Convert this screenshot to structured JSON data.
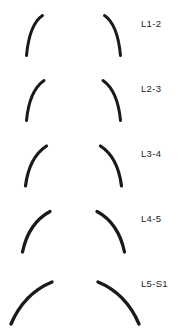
{
  "figure": {
    "width": 187,
    "height": 331,
    "background_color": "#ffffff",
    "stroke_color": "#1a1a1a",
    "label_color": "#232323"
  },
  "levels": [
    {
      "label": "L1-2",
      "label_x": 141,
      "label_y": 19,
      "left_arc": "M 42.5 15.5 C 33.5 21.5 28.5 34.5 26.5 55.5",
      "right_arc": "M 104.5 15.5 C 113.5 21.5 118.5 34.5 120.5 55.5",
      "stroke_width": 3.0
    },
    {
      "label": "L2-3",
      "label_x": 141,
      "label_y": 84,
      "left_arc": "M 44.0 80.5 C 34.0 87.5 28.5 99.5 26.5 120.5",
      "right_arc": "M 103.0 80.5 C 113.0 87.5 118.5 99.5 120.5 120.5",
      "stroke_width": 3.0
    },
    {
      "label": "L3-4",
      "label_x": 141,
      "label_y": 149,
      "left_arc": "M 46.5 146.0 C 35.0 153.5 28.0 166.0 25.5 186.0",
      "right_arc": "M 100.5 146.0 C 112.0 153.5 119.0 166.0 121.5 186.0",
      "stroke_width": 3.2
    },
    {
      "label": "L4-5",
      "label_x": 141,
      "label_y": 214,
      "left_arc": "M 50.0 211.5 C 36.0 219.0 26.5 233.0 22.5 252.0",
      "right_arc": "M 97.0 211.5 C 111.0 219.0 120.5 233.0 124.5 252.0",
      "stroke_width": 3.3
    },
    {
      "label": "L5-S1",
      "label_x": 141,
      "label_y": 279,
      "left_arc": "M 52.0 282.0 C 35.0 289.0 20.0 303.0 11.0 324.0",
      "right_arc": "M 98.0 282.0 C 115.0 289.0 130.0 303.0 139.0 324.0",
      "stroke_width": 3.4
    }
  ]
}
